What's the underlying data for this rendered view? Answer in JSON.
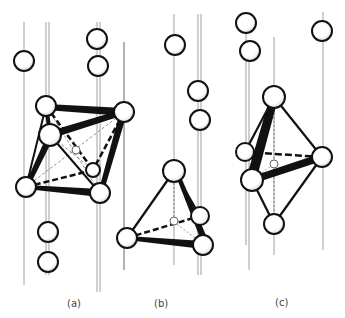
{
  "figure": {
    "panels": [
      {
        "id": "a",
        "label": "(a)",
        "shape": "octahedron",
        "label_x": 67,
        "label_y": 298
      },
      {
        "id": "b",
        "label": "(b)",
        "shape": "tetrahedron",
        "label_x": 154,
        "label_y": 298
      },
      {
        "id": "c",
        "label": "(c)",
        "shape": "trigonal-bipyramid",
        "label_x": 275,
        "label_y": 297
      }
    ],
    "colors": {
      "ink": "#111111",
      "rod": "#888888",
      "atom_fill": "#ffffff"
    }
  }
}
